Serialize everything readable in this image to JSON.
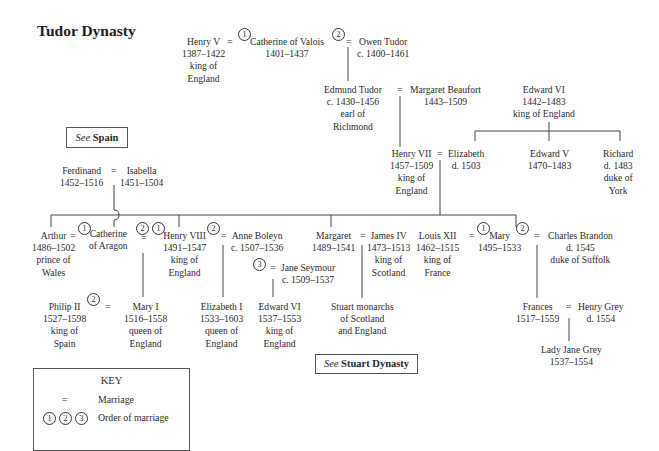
{
  "title": "Tudor Dynasty",
  "symbols": {
    "marriage": "=",
    "order1": "1",
    "order2": "2",
    "order3": "3"
  },
  "people": {
    "henry_v": {
      "name": "Henry V",
      "dates": "1387–1422",
      "title1": "king of",
      "title2": "England"
    },
    "catherine_valois": {
      "name": "Catherine of Valois",
      "dates": "1401–1437"
    },
    "owen_tudor": {
      "name": "Owen Tudor",
      "dates": "c. 1400–1461"
    },
    "edmund_tudor": {
      "name": "Edmund Tudor",
      "dates": "c. 1430–1456",
      "title1": "earl of",
      "title2": "Richmond"
    },
    "margaret_beaufort": {
      "name": "Margaret Beaufort",
      "dates": "1443–1509"
    },
    "edward_iv": {
      "name": "Edward VI",
      "dates": "1442–1483",
      "title1": "king of England"
    },
    "henry_vii": {
      "name": "Henry VII",
      "dates": "1457–1509",
      "title1": "king of",
      "title2": "England"
    },
    "elizabeth_york": {
      "name": "Elizabeth",
      "dates": "d. 1503"
    },
    "edward_v": {
      "name": "Edward V",
      "dates": "1470–1483"
    },
    "richard": {
      "name": "Richard",
      "dates": "d. 1483",
      "title1": "duke of",
      "title2": "York"
    },
    "ferdinand": {
      "name": "Ferdinand",
      "dates": "1452–1516"
    },
    "isabella": {
      "name": "Isabella",
      "dates": "1451–1504"
    },
    "arthur": {
      "name": "Arthur",
      "dates": "1486–1502",
      "title1": "prince of",
      "title2": "Wales"
    },
    "catherine_aragon": {
      "name": "Catherine",
      "title1": "of Aragon"
    },
    "henry_viii": {
      "name": "Henry VIII",
      "dates": "1491–1547",
      "title1": "king of",
      "title2": "England"
    },
    "anne_boleyn": {
      "name": "Anne Boleyn",
      "dates": "c. 1507–1536"
    },
    "jane_seymour": {
      "name": "Jane Seymour",
      "dates": "c. 1509–1537"
    },
    "margaret": {
      "name": "Margaret",
      "dates": "1489–1541"
    },
    "james_iv": {
      "name": "James IV",
      "dates": "1473–1513",
      "title1": "king of",
      "title2": "Scotland"
    },
    "louis_xii": {
      "name": "Louis XII",
      "dates": "1462–1515",
      "title1": "king of",
      "title2": "France"
    },
    "mary_tudor": {
      "name": "Mary",
      "dates": "1495–1533"
    },
    "charles_brandon": {
      "name": "Charles Brandon",
      "dates": "d. 1545",
      "title1": "duke of Suffolk"
    },
    "philip_ii": {
      "name": "Philip II",
      "dates": "1527–1598",
      "title1": "king of",
      "title2": "Spain"
    },
    "mary_i": {
      "name": "Mary I",
      "dates": "1516–1558",
      "title1": "queen of",
      "title2": "England"
    },
    "elizabeth_i": {
      "name": "Elizabeth I",
      "dates": "1533–1603",
      "title1": "queen of",
      "title2": "England"
    },
    "edward_vi": {
      "name": "Edward VI",
      "dates": "1537–1553",
      "title1": "king of",
      "title2": "England"
    },
    "stuart": {
      "name": "Stuart monarchs",
      "title1": "of Scotland",
      "title2": "and England"
    },
    "frances": {
      "name": "Frances",
      "dates": "1517–1559"
    },
    "henry_grey": {
      "name": "Henry Grey",
      "dates": "d. 1554"
    },
    "lady_jane_grey": {
      "name": "Lady Jane Grey",
      "dates": "1537–1554"
    }
  },
  "crossrefs": {
    "spain": {
      "see": "See",
      "target": "Spain"
    },
    "stuart": {
      "see": "See",
      "target": "Stuart Dynasty"
    }
  },
  "key": {
    "title": "KEY",
    "rows": [
      {
        "symbol": "=",
        "label": "Marriage"
      },
      {
        "symbol": "①②③",
        "label": "Order of marriage"
      }
    ],
    "circles": [
      "1",
      "2",
      "3"
    ]
  }
}
